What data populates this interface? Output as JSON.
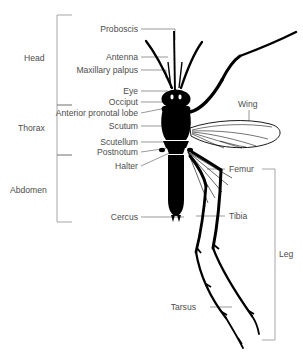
{
  "figure": {
    "background_color": "#ffffff",
    "ink_color": "#000000",
    "label_color": "#4d4d4d",
    "leader_color": "#6e6e6e",
    "bracket_color": "#8a8a8a"
  },
  "body_regions": [
    {
      "label": "Head"
    },
    {
      "label": "Thorax"
    },
    {
      "label": "Abdomen"
    }
  ],
  "left_labels": [
    {
      "label": "Proboscis"
    },
    {
      "label": "Antenna"
    },
    {
      "label": "Maxillary palpus"
    },
    {
      "label": "Eye"
    },
    {
      "label": "Occiput"
    },
    {
      "label": "Anterior pronotal lobe"
    },
    {
      "label": "Scutum"
    },
    {
      "label": "Scutellum"
    },
    {
      "label": "Postnotum"
    },
    {
      "label": "Halter"
    },
    {
      "label": "Cercus"
    }
  ],
  "right_labels": [
    {
      "label": "Wing"
    },
    {
      "label": "Femur"
    },
    {
      "label": "Tibia"
    },
    {
      "label": "Tarsus"
    }
  ],
  "right_regions": [
    {
      "label": "Leg"
    }
  ]
}
